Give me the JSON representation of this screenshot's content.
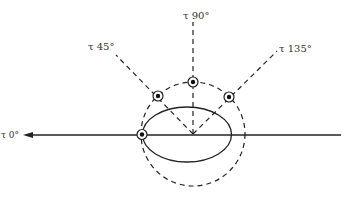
{
  "figure": {
    "type": "polarization-diagram",
    "labels": {
      "tau_0": "τ 0°",
      "tau_45": "τ 45°",
      "tau_90": "τ 90°",
      "tau_135": "τ 135°"
    },
    "colors": {
      "line": "#222222",
      "text": "#333333",
      "background": "#ffffff"
    },
    "elements": {
      "axis": "horizontal solid line with arrowhead pointing left toward τ 0°",
      "ellipse": "solid ellipse centered on axis",
      "circle": "dashed circle through four marked points",
      "rays": "dashed rays from center at 45°, 90°, 135°",
      "markers": [
        "0°",
        "45°",
        "90°",
        "135°"
      ]
    }
  }
}
